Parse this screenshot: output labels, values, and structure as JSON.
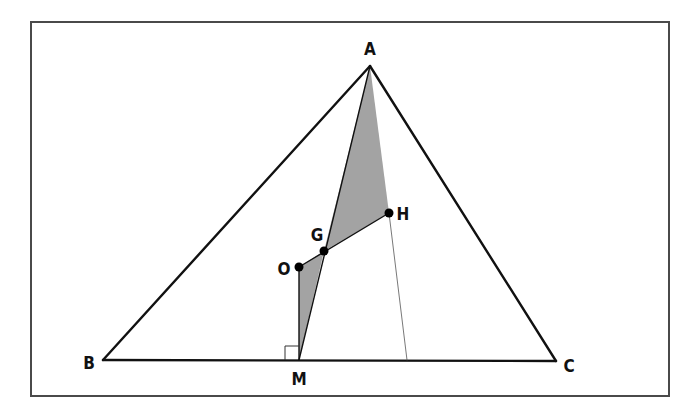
{
  "diagram": {
    "frame": {
      "x": 31,
      "y": 22,
      "width": 638,
      "height": 374,
      "stroke": "#444444"
    },
    "points": {
      "A": {
        "x": 370,
        "y": 66,
        "label": "A",
        "lx": 370,
        "ly": 55,
        "anchor": "middle"
      },
      "B": {
        "x": 103,
        "y": 360,
        "label": "B",
        "lx": 89,
        "ly": 369,
        "anchor": "middle"
      },
      "C": {
        "x": 556,
        "y": 361,
        "label": "C",
        "lx": 569,
        "ly": 372,
        "anchor": "middle"
      },
      "M": {
        "x": 299,
        "y": 360,
        "label": "M",
        "lx": 299,
        "ly": 385,
        "anchor": "middle"
      },
      "O": {
        "x": 299,
        "y": 267,
        "label": "O",
        "lx": 284,
        "ly": 275,
        "anchor": "middle"
      },
      "G": {
        "x": 324,
        "y": 251,
        "label": "G",
        "lx": 317,
        "ly": 241,
        "anchor": "middle"
      },
      "H": {
        "x": 389,
        "y": 213,
        "label": "H",
        "lx": 403,
        "ly": 220,
        "anchor": "middle"
      },
      "D": {
        "x": 407,
        "y": 360
      }
    },
    "shaded_regions": [
      {
        "name": "triangle-AGH",
        "points": [
          "A",
          "H",
          "G"
        ]
      },
      {
        "name": "triangle-OGM",
        "points": [
          "O",
          "G",
          "M"
        ]
      }
    ],
    "segments": [
      {
        "from": "A",
        "to": "B",
        "weight": "thick"
      },
      {
        "from": "B",
        "to": "C",
        "weight": "thick"
      },
      {
        "from": "C",
        "to": "A",
        "weight": "thick"
      },
      {
        "from": "A",
        "to": "M",
        "weight": "thin"
      },
      {
        "from": "O",
        "to": "M",
        "weight": "thin"
      },
      {
        "from": "O",
        "to": "H",
        "weight": "thin"
      },
      {
        "from": "H",
        "to": "D",
        "weight": "hair"
      }
    ],
    "marked_points": [
      "O",
      "G",
      "H"
    ],
    "right_angle_marker": {
      "at": "M",
      "size": 14
    },
    "colors": {
      "line": "#111111",
      "shade": "#a3a3a3",
      "frame": "#4a4a4a",
      "dot": "#000000"
    }
  }
}
